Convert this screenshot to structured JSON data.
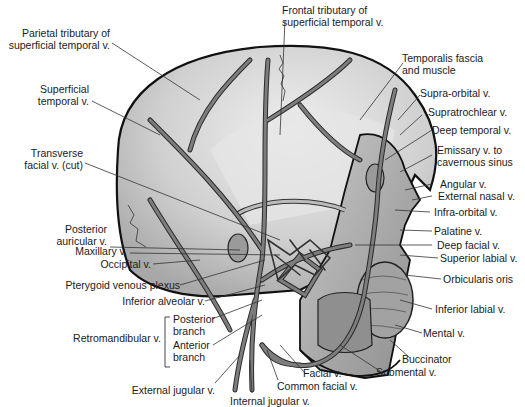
{
  "figure": {
    "colors": {
      "background": "#ffffff",
      "skin_light": "#d9d9d9",
      "skin_mid": "#b3b3b3",
      "skin_dark": "#8c8c8c",
      "vein_fill": "#7a7a7a",
      "vein_stroke": "#2b2b2b",
      "outline": "#111111",
      "leader_line": "#333333",
      "text": "#1a1a1a"
    }
  },
  "labels": {
    "parietal_tributary": [
      "Parietal tributary of",
      "superficial temporal v."
    ],
    "frontal_tributary": [
      "Frontal tributary of",
      "superficial temporal v."
    ],
    "temporalis": [
      "Temporalis fascia",
      "and muscle"
    ],
    "superficial_temporal": [
      "Superficial",
      "temporal v."
    ],
    "supra_orbital": "Supra-orbital v.",
    "supratrochlear": "Supratrochlear v.",
    "deep_temporal": "Deep temporal v.",
    "emissary": [
      "Emissary v. to",
      "cavernous sinus"
    ],
    "transverse_facial": [
      "Transverse",
      "facial v. (cut)"
    ],
    "angular": "Angular v.",
    "external_nasal": "External nasal v.",
    "infra_orbital": "Infra-orbital v.",
    "posterior_auricular": [
      "Posterior",
      "auricular v."
    ],
    "palatine": "Palatine v.",
    "maxillary": "Maxillary v.",
    "deep_facial": "Deep facial v.",
    "superior_labial": "Superior labial v.",
    "occipital": "Occipital v.",
    "pterygoid": "Pterygoid venous plexus",
    "orbicularis": "Orbicularis oris",
    "inferior_alveolar": "Inferior alveolar v.",
    "inferior_labial": "Inferior labial v.",
    "retromandibular": "Retromandibular v.",
    "posterior_branch": [
      "Posterior",
      "branch"
    ],
    "anterior_branch": [
      "Anterior",
      "branch"
    ],
    "mental": "Mental v.",
    "buccinator": "Buccinator",
    "facial": "Facial v.",
    "submental": "Submental v.",
    "external_jugular": "External jugular v.",
    "common_facial": "Common facial v.",
    "internal_jugular": "Internal jugular v."
  }
}
